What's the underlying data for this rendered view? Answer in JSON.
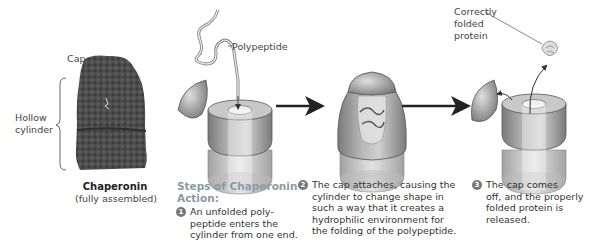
{
  "structure": {
    "cap_label": "Cap",
    "hollow_cylinder_label_line1": "Hollow",
    "hollow_cylinder_label_line2": "cylinder",
    "title": "Chaperonin",
    "subtitle": "(fully assembled)"
  },
  "labels": {
    "polypeptide": "Polypeptide",
    "folded_line1": "Correctly",
    "folded_line2": "folded",
    "folded_line3": "protein"
  },
  "steps": {
    "title_line1": "Steps of Chaperonin",
    "title_line2": "Action:",
    "items": [
      {
        "number": "1",
        "text": "An unfolded poly-\npeptide enters the\ncylinder from one end."
      },
      {
        "number": "2",
        "text": "The cap attaches, causing the\ncylinder to change shape in\nsuch a way that it creates a\nhydrophilic environment for\nthe folding of the polypeptide."
      },
      {
        "number": "3",
        "text": "The cap comes\noff, and the properly\nfolded protein is\nreleased."
      }
    ]
  },
  "colors": {
    "chaperonin": "#4a4a4a",
    "cylinder": "#9a9a9a",
    "steps_title": "#8a9aa6",
    "arrow": "#222222"
  }
}
